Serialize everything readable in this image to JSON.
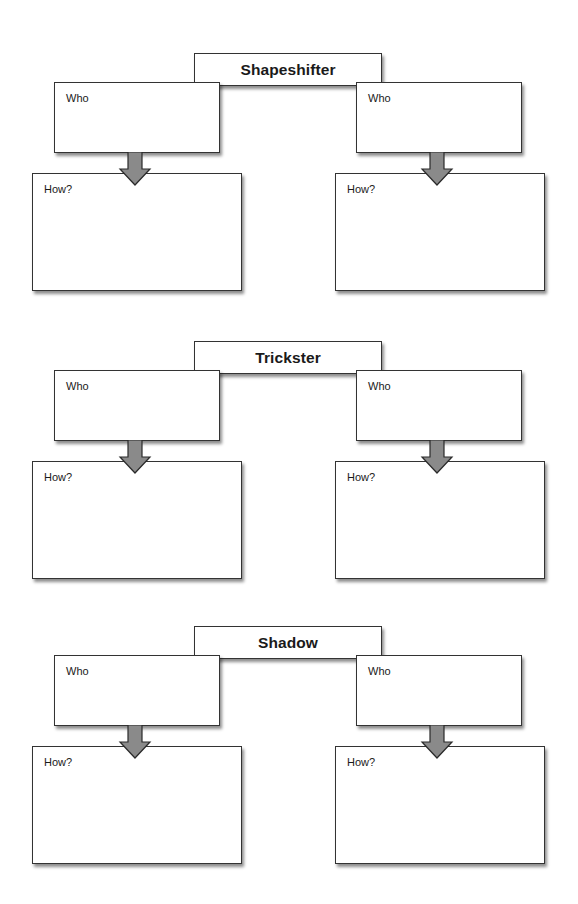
{
  "worksheet": {
    "sections": [
      {
        "title": "Shapeshifter",
        "left": {
          "who_label": "Who",
          "how_label": "How?"
        },
        "right": {
          "who_label": "Who",
          "how_label": "How?"
        }
      },
      {
        "title": "Trickster",
        "left": {
          "who_label": "Who",
          "how_label": "How?"
        },
        "right": {
          "who_label": "Who",
          "how_label": "How?"
        }
      },
      {
        "title": "Shadow",
        "left": {
          "who_label": "Who",
          "how_label": "How?"
        },
        "right": {
          "who_label": "Who",
          "how_label": "How?"
        }
      }
    ],
    "colors": {
      "arrow_fill": "#8a8a8a",
      "border": "#333333",
      "background": "#ffffff"
    }
  }
}
